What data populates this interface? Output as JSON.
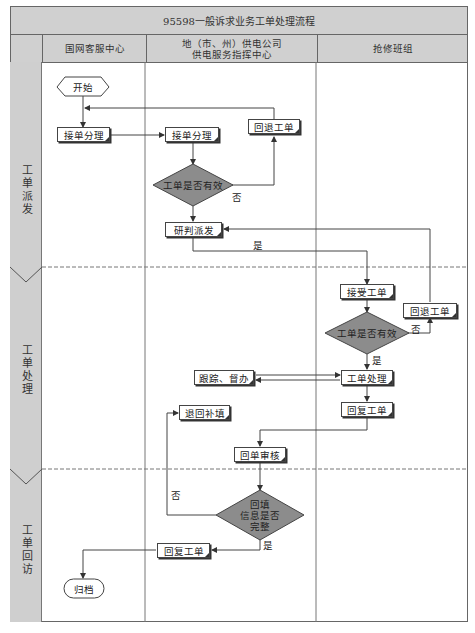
{
  "title": "95598一般诉求业务工单处理流程",
  "lanes": [
    {
      "id": "customer-service-center",
      "label": "国网客服中心"
    },
    {
      "id": "power-supply-command-center",
      "label": "地（市、州）供电公司\n供电服务指挥中心",
      "line1": "地（市、州）供电公司",
      "line2": "供电服务指挥中心"
    },
    {
      "id": "repair-team",
      "label": "抢修班组"
    }
  ],
  "stages": [
    {
      "id": "dispatch",
      "label": "工单派发"
    },
    {
      "id": "processing",
      "label": "工单处理"
    },
    {
      "id": "revisit",
      "label": "工单回访"
    }
  ],
  "nodes": {
    "start": "开始",
    "accept_customer": "接单分理",
    "accept_center": "接单分理",
    "return_center": "回退工单",
    "valid_check_center": "工单是否有效",
    "judge_dispatch": "研判派发",
    "receive_ticket": "接受工单",
    "return_repair": "回退工单",
    "valid_check_repair": "工单是否有效",
    "track_supervise": "跟踪、督办",
    "ticket_process": "工单处理",
    "return_fill": "退回补填",
    "reply_repair": "回复工单",
    "review": "回单审核",
    "info_complete_line1": "回填",
    "info_complete_line2": "信息是否",
    "info_complete_line3": "完整",
    "reply_customer": "回复工单",
    "archive": "归档"
  },
  "edge_labels": {
    "no_center": "否",
    "yes_dispatch": "是",
    "no_repair": "否",
    "yes_repair": "是",
    "no_review": "否",
    "yes_review": "是"
  },
  "colors": {
    "header_bg": "#d0d0d0",
    "decision_fill": "#8c8c8c",
    "line": "#444444"
  }
}
